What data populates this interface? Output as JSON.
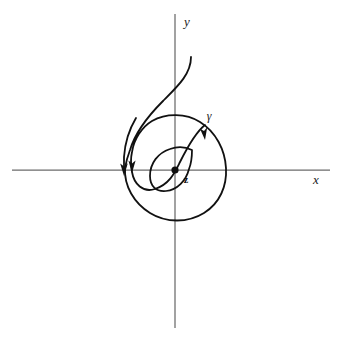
{
  "figure": {
    "kind": "spiral-curve-diagram",
    "background_color": "#ffffff",
    "width": 345,
    "height": 342
  },
  "axes": {
    "x_label": "x",
    "y_label": "y",
    "axis_color": "#6b6b6b",
    "origin": {
      "x": 175,
      "y": 170
    },
    "x_axis": {
      "x_start": 12,
      "x_end": 330,
      "y": 170
    },
    "y_axis": {
      "x": 175,
      "y_start": 14,
      "y_end": 328
    }
  },
  "point": {
    "label": "z",
    "x": 175,
    "y": 170,
    "radius": 3.6,
    "color": "#101010"
  },
  "curve": {
    "label": "γ",
    "label_x": 209,
    "label_y": 120,
    "color": "#111111",
    "stroke_width": 1.8,
    "description": "clockwise inward spiral about z with trailing tail rising to upper right"
  },
  "arrowheads": [
    {
      "name": "arrowhead-outer-left",
      "x": 120,
      "y": 166,
      "direction": "down"
    },
    {
      "name": "arrowhead-inner-left",
      "x": 128,
      "y": 163,
      "direction": "down"
    },
    {
      "name": "arrowhead-upper-right",
      "x": 203,
      "y": 133,
      "direction": "clockwise"
    }
  ],
  "geometry": {
    "outer_loop": {
      "left_x": 124,
      "right_x": 226,
      "top_y": 115,
      "bottom_y": 221
    },
    "middle_loop": {
      "left_x": 137,
      "right_x": 205,
      "top_y": 124,
      "bottom_y": 190
    },
    "inner_loop": {
      "left_x": 150,
      "right_x": 192,
      "top_y": 146,
      "bottom_y": 191
    },
    "tail_end": {
      "x": 191,
      "y": 57
    }
  }
}
